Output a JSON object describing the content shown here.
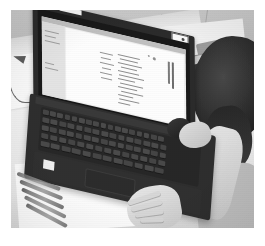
{
  "photo": {
    "subject": "Person using a laptop computer at a desk",
    "style": "black-and-white photograph with white border",
    "orientation": "landscape",
    "alt_text": "Grayscale photo of an open laptop on a light desk. A document is displayed on the laptop screen. A person with dark hair sits at the right, one hand on a mouse beside the laptop and the other hand resting on the desk in the foreground. Pens lie on the desk at the left and cables are coiled on the desk behind the laptop."
  },
  "objects": {
    "laptop": {
      "name": "laptop",
      "lid_label": "laptop-lid",
      "screen_label": "laptop-screen",
      "keyboard_label": "laptop-keyboard",
      "touchpad_label": "laptop-touchpad",
      "sticker_label": "palmrest-sticker",
      "badge_label": "lid-badge",
      "color": "#2e2e2e"
    },
    "screen_window": {
      "titlebar_label": "window-titlebar",
      "sidebar_label": "window-sidebar",
      "document_label": "document-page",
      "heading_label": "document-heading",
      "body_text_label": "document-body-text",
      "background": "#e9e9e7"
    },
    "desk": {
      "label": "desk-surface",
      "color": "#e8e8e8"
    },
    "wall": {
      "label": "wall-background",
      "color": "#c0c0c0"
    },
    "papers": [
      {
        "label": "paper-sheet-left"
      },
      {
        "label": "paper-sheet-foreground"
      },
      {
        "label": "paper-sheet-right"
      }
    ],
    "pens": {
      "label": "pens-on-desk",
      "count": 5
    },
    "cables": {
      "label": "coiled-cables",
      "count": 2
    },
    "case": {
      "label": "pencil-case"
    },
    "person": {
      "head_label": "person-head",
      "arm_label": "person-arm",
      "hand_mouse_label": "hand-on-mouse",
      "hand_desk_label": "hand-on-desk",
      "hair_color": "#2b2b2b"
    },
    "mouse": {
      "label": "computer-mouse",
      "color": "#2a2a2a"
    }
  },
  "frame": {
    "label": "photo-white-border",
    "color": "#ffffff"
  }
}
